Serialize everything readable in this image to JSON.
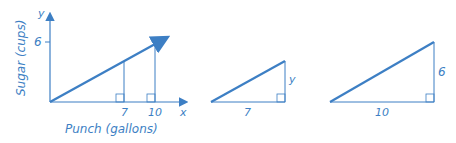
{
  "colors": {
    "stroke": "#3d7fc4",
    "text": "#3d7fc4"
  },
  "graph": {
    "y_axis_label": "Sugar (cups)",
    "x_axis_label": "Punch (gallons)",
    "y_axis_var": "y",
    "x_axis_var": "x",
    "y_tick": "6",
    "x_ticks": [
      "7",
      "10"
    ]
  },
  "triangle_small": {
    "base_label": "7",
    "height_label": "y"
  },
  "triangle_large": {
    "base_label": "10",
    "height_label": "6"
  }
}
